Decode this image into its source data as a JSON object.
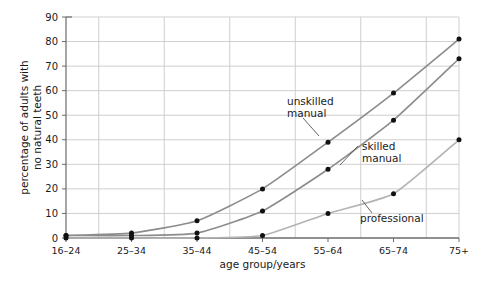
{
  "chart_data": {
    "type": "line",
    "title": "",
    "xlabel": "age group/years",
    "ylabel": "percentage of adults with no natural teeth",
    "categories": [
      "16–24",
      "25–34",
      "35–44",
      "45–54",
      "55–64",
      "65–74",
      "75+"
    ],
    "ylim": [
      0,
      90
    ],
    "ytick_values": [
      0,
      10,
      20,
      30,
      40,
      50,
      60,
      70,
      80,
      90
    ],
    "ytick_labels": [
      "0",
      "10",
      "20",
      "30",
      "40",
      "50",
      "60",
      "70",
      "80",
      "90"
    ],
    "grid": "horizontal major every 10; vertical lines at category midpoints",
    "legend": "none (inline annotations with leader lines)",
    "series": [
      {
        "name": "unskilled manual",
        "color": "#8c8c8c",
        "marker": "filled-circle",
        "values": [
          1,
          2,
          7,
          20,
          39,
          59,
          81
        ]
      },
      {
        "name": "skilled manual",
        "color": "#8c8c8c",
        "marker": "filled-circle",
        "values": [
          1,
          1,
          2,
          11,
          28,
          48,
          73
        ]
      },
      {
        "name": "professional",
        "color": "#b3b3b3",
        "marker": "filled-circle",
        "values": [
          0,
          0,
          0,
          1,
          10,
          18,
          40
        ]
      }
    ],
    "annotations": [
      {
        "text_line1": "unskilled",
        "text_line2": "manual",
        "series": "unskilled manual"
      },
      {
        "text_line1": "skilled",
        "text_line2": "manual",
        "series": "skilled manual"
      },
      {
        "text_line1": "professional",
        "text_line2": "",
        "series": "professional"
      }
    ],
    "colors": {
      "grid": "#c9c9c9",
      "axis": "#5a5a5a",
      "marker": "#111111",
      "background": "#ffffff"
    }
  }
}
